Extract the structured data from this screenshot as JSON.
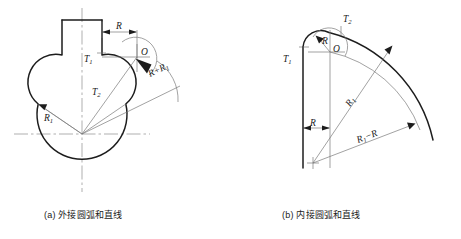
{
  "figure": {
    "panels": [
      {
        "id": "a",
        "caption": "(a) 外接圆弧和直线",
        "labels": {
          "R": "R",
          "R1": "R",
          "R1_sub": "1",
          "R_plus_R1": "R+R",
          "R_plus_R1_sub": "1",
          "O": "O",
          "T1": "T",
          "T1_sub": "1",
          "T2": "T",
          "T2_sub": "2"
        }
      },
      {
        "id": "b",
        "caption": "(b) 内接圆弧和直线",
        "labels": {
          "R": "R",
          "R_lower": "R",
          "R1": "R",
          "R1_sub": "1",
          "R1_minus_R": "R",
          "R1_minus_R_sub": "1",
          "R1_minus_R_tail": "−R",
          "O": "O",
          "T1": "T",
          "T1_sub": "1",
          "T2": "T",
          "T2_sub": "2"
        }
      }
    ],
    "colors": {
      "outline": "#1d1d1d",
      "thin_line": "#7a7a7a",
      "center_line": "#8d8d8d",
      "background": "#ffffff",
      "text": "#1a1a1a"
    }
  }
}
